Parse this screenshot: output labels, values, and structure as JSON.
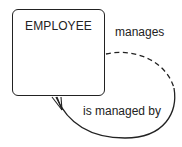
{
  "diagram": {
    "type": "entity-relationship",
    "entity": {
      "name": "EMPLOYEE"
    },
    "relationship": {
      "kind": "recursive",
      "labels": {
        "forward": "manages",
        "reverse": "is managed by"
      },
      "forward_end": {
        "line_style": "dashed",
        "meaning": "optional"
      },
      "reverse_end": {
        "line_style": "solid",
        "meaning": "mandatory",
        "cardinality_symbol": "crows-foot-many"
      }
    },
    "colors": {
      "stroke": "#222222",
      "background": "#ffffff"
    }
  }
}
